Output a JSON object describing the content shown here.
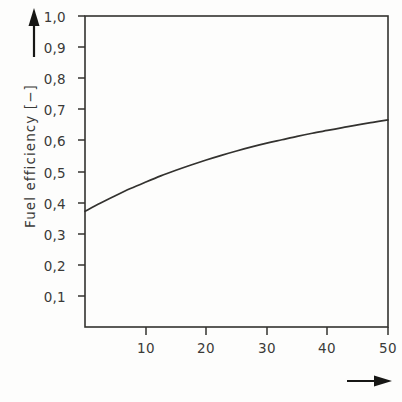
{
  "figure": {
    "background_color": "#fdfdfc",
    "ink_color": "#33322f",
    "text_color": "#3a3a38"
  },
  "axes": {
    "y_label": "Fuel efficiency  [−]",
    "x_label": "",
    "y_arrow": "up-arrow",
    "x_arrow": "right-arrow"
  },
  "chart_data": {
    "type": "line",
    "title": "",
    "subtitle": "",
    "xlabel": "",
    "ylabel": "Fuel efficiency [−]",
    "xlim": [
      0,
      50
    ],
    "ylim": [
      0,
      1.0
    ],
    "grid": false,
    "legend": null,
    "xticks": [
      10,
      20,
      30,
      40,
      50
    ],
    "xtick_labels": [
      "10",
      "20",
      "30",
      "40",
      "50"
    ],
    "yticks": [
      0.1,
      0.2,
      0.3,
      0.4,
      0.5,
      0.6,
      0.7,
      0.8,
      0.9,
      1.0
    ],
    "ytick_labels": [
      "0,1",
      "0,2",
      "0,3",
      "0,4",
      "0,5",
      "0,6",
      "0,7",
      "0,8",
      "0,9",
      "1,0"
    ],
    "series": [
      {
        "name": "Fuel efficiency",
        "color": "#33322f",
        "x": [
          0,
          2.5,
          5,
          7.5,
          10,
          12.5,
          15,
          17.5,
          20,
          22.5,
          25,
          27.5,
          30,
          32.5,
          35,
          37.5,
          40,
          42.5,
          45,
          47.5,
          50
        ],
        "values": [
          0.372,
          0.398,
          0.422,
          0.445,
          0.466,
          0.486,
          0.504,
          0.521,
          0.537,
          0.552,
          0.566,
          0.579,
          0.591,
          0.602,
          0.613,
          0.623,
          0.632,
          0.641,
          0.65,
          0.658,
          0.666
        ]
      }
    ]
  }
}
